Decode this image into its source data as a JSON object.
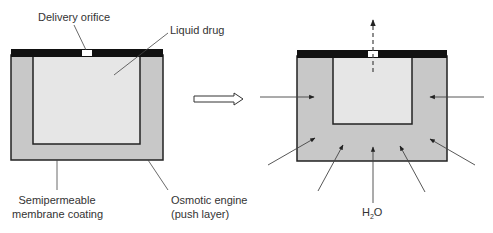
{
  "labels": {
    "delivery_orifice": "Delivery orifice",
    "liquid_drug": "Liquid drug",
    "membrane_line1": "Semipermeable",
    "membrane_line2": "membrane coating",
    "engine_line1": "Osmotic engine",
    "engine_line2": "(push layer)",
    "water_h": "H",
    "water_sub": "2",
    "water_o": "O"
  },
  "colors": {
    "cap": "#111111",
    "push_layer": "#c8c8c8",
    "drug": "#e6e6e6",
    "outline": "#222222",
    "arrow": "#444444",
    "orifice": "#ffffff"
  }
}
